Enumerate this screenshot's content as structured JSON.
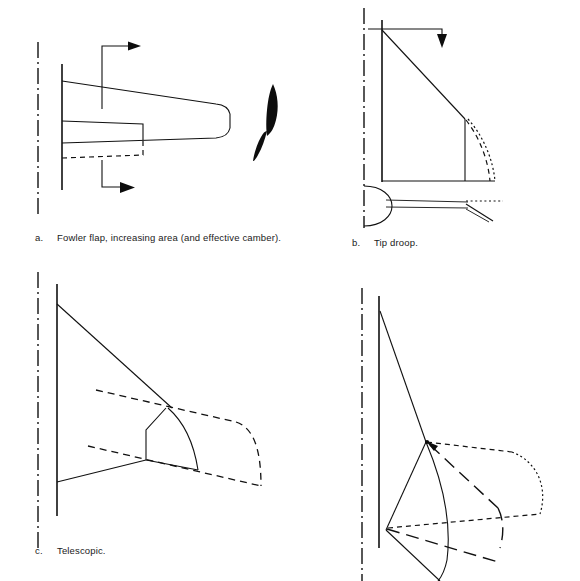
{
  "sheet": {
    "title": "Variable geometry wing planform concepts",
    "background_color": "#ffffff",
    "ink_color": "#111111",
    "width": 580,
    "height": 581
  },
  "panels": [
    {
      "id": "a",
      "letter": "a.",
      "caption": "Fowler flap, increasing area (and effective camber).",
      "subject": "fowler-flap-planform",
      "elements": [
        "aircraft-centerline",
        "wing-root-chord",
        "wing-planform-tapered",
        "rounded-wingtip",
        "flap-panel-retracted",
        "flap-panel-extended-dashed",
        "motion-arrow-upper",
        "motion-arrow-lower",
        "airfoil-section-silhouette"
      ]
    },
    {
      "id": "b",
      "letter": "b.",
      "caption": "Tip droop.",
      "subject": "tip-droop-planform",
      "elements": [
        "aircraft-centerline",
        "fuselage-side",
        "wing-leading-edge-swept",
        "wing-trailing-edge",
        "tip-hinge-line",
        "droop-arc-dashed",
        "droop-arc-dotted",
        "droop-direction-arrow",
        "side-view-fuselage-nose",
        "side-view-drooped-tip"
      ]
    },
    {
      "id": "c",
      "letter": "c.",
      "caption": "Telescopic.",
      "subject": "telescopic-wing-planform",
      "elements": [
        "aircraft-centerline",
        "wing-root-chord",
        "wing-leading-edge",
        "wing-trailing-edge",
        "inner-panel-outline",
        "telescoping-arc",
        "extended-panel-dashed-leading-edge",
        "extended-panel-dashed-trailing-edge",
        "extended-tip-dashed"
      ]
    },
    {
      "id": "d",
      "letter": "",
      "caption": "",
      "subject": "variable-sweep-planform",
      "elements": [
        "aircraft-centerline",
        "wing-root-chord",
        "wing-leading-edge-swept-back",
        "pivot-point",
        "wing-swept-position-solid",
        "wing-forward-position-dashed",
        "wing-intermediate-position-long-dash",
        "extended-tip-dotted-arc"
      ]
    }
  ]
}
